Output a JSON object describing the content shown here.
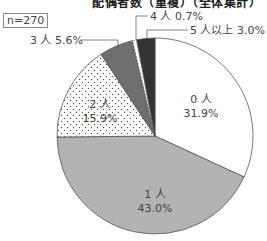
{
  "chart_data": {
    "type": "pie",
    "title": "配偶者数（重複）（全体集計）",
    "sample_size_label": "n=270",
    "start_angle_deg": 0,
    "direction": "clockwise",
    "slices": [
      {
        "label": "0人",
        "value": 31.9,
        "fill": "#ffffff",
        "pattern": "none"
      },
      {
        "label": "1人",
        "value": 43.0,
        "fill": "#b3b3b3",
        "pattern": "none"
      },
      {
        "label": "2人",
        "value": 15.9,
        "fill": "#ffffff",
        "pattern": "dots"
      },
      {
        "label": "3人",
        "value": 5.6,
        "fill": "#6e6e6e",
        "pattern": "none"
      },
      {
        "label": "4人",
        "value": 0.7,
        "fill": "#ffffff",
        "pattern": "none"
      },
      {
        "label": "5人以上",
        "value": 3.0,
        "fill": "#333333",
        "pattern": "none"
      }
    ],
    "labels": {
      "s0_name": "0 人",
      "s0_pct": "31.9%",
      "s1_name": "1 人",
      "s1_pct": "43.0%",
      "s2_name": "2 人",
      "s2_pct": "15.9%",
      "s3": "3 人 5.6%",
      "s4": "4 人 0.7%",
      "s5": "5 人以上 3.0%"
    }
  }
}
